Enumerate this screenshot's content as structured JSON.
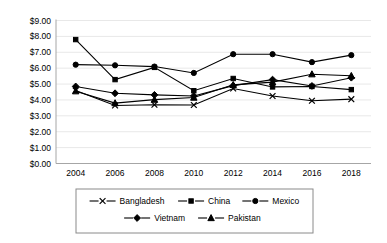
{
  "chart_data": {
    "type": "line",
    "title": "",
    "xlabel": "",
    "ylabel": "",
    "categories": [
      "2004",
      "2006",
      "2008",
      "2010",
      "2012",
      "2014",
      "2016",
      "2018"
    ],
    "x": [
      2004,
      2006,
      2008,
      2010,
      2012,
      2014,
      2016,
      2018
    ],
    "ylim": [
      0,
      9
    ],
    "ytick_step": 1,
    "ytick_labels": [
      "$0.00",
      "$1.00",
      "$2.00",
      "$3.00",
      "$4.00",
      "$5.00",
      "$6.00",
      "$7.00",
      "$8.00",
      "$9.00"
    ],
    "ytick_values": [
      0,
      1,
      2,
      3,
      4,
      5,
      6,
      7,
      8,
      9
    ],
    "currency_prefix": "$",
    "grid": "horizontal",
    "legend_position": "bottom",
    "series": [
      {
        "name": "Bangladesh",
        "marker": "x-cross",
        "values": [
          4.6,
          3.65,
          3.7,
          3.68,
          4.72,
          4.25,
          3.95,
          4.05
        ]
      },
      {
        "name": "China",
        "marker": "square",
        "values": [
          7.8,
          5.28,
          6.05,
          4.58,
          5.35,
          4.82,
          4.85,
          4.65
        ]
      },
      {
        "name": "Mexico",
        "marker": "circle",
        "values": [
          6.22,
          6.18,
          6.1,
          5.7,
          6.88,
          6.88,
          6.38,
          6.82
        ]
      },
      {
        "name": "Vietnam",
        "marker": "diamond",
        "values": [
          4.85,
          4.42,
          4.32,
          4.25,
          4.9,
          5.28,
          4.88,
          5.4
        ]
      },
      {
        "name": "Pakistan",
        "marker": "triangle",
        "values": [
          4.55,
          3.8,
          4.02,
          4.15,
          4.95,
          5.12,
          5.62,
          5.52
        ]
      }
    ]
  },
  "legend": {
    "items": [
      {
        "label": "Bangladesh",
        "marker": "x-cross"
      },
      {
        "label": "China",
        "marker": "square"
      },
      {
        "label": "Mexico",
        "marker": "circle"
      },
      {
        "label": "Vietnam",
        "marker": "diamond"
      },
      {
        "label": "Pakistan",
        "marker": "triangle"
      }
    ]
  },
  "colors": {
    "series": "#000000",
    "grid": "#e8e8e8",
    "axis": "#a6a6a6",
    "legend_border": "#8a8a8a",
    "background": "#ffffff"
  }
}
